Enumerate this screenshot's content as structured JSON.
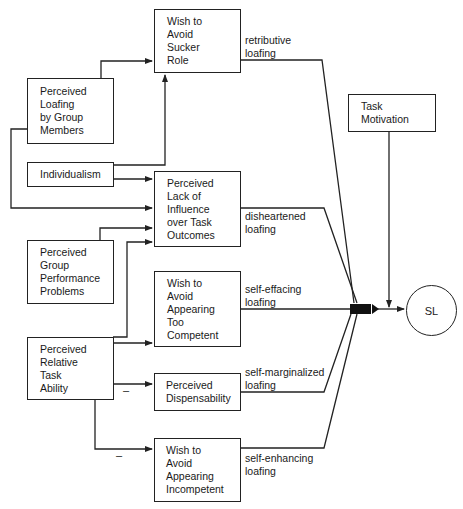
{
  "diagram": {
    "type": "path-model",
    "nodes": {
      "sucker": {
        "lines": [
          "Wish to",
          "Avoid",
          "Sucker",
          "Role"
        ]
      },
      "loafing_members": {
        "lines": [
          "Perceived",
          "Loafing",
          "by Group",
          "Members"
        ]
      },
      "individualism": {
        "lines": [
          "Individualism"
        ]
      },
      "lack_influence": {
        "lines": [
          "Perceived",
          "Lack of",
          "Influence",
          "over Task",
          "Outcomes"
        ]
      },
      "group_problems": {
        "lines": [
          "Perceived",
          "Group",
          "Performance",
          "Problems"
        ]
      },
      "too_competent": {
        "lines": [
          "Wish to",
          "Avoid",
          "Appearing",
          "Too",
          "Competent"
        ]
      },
      "task_ability": {
        "lines": [
          "Perceived",
          "Relative",
          "Task",
          "Ability"
        ]
      },
      "dispensability": {
        "lines": [
          "Perceived",
          "Dispensability"
        ]
      },
      "incompetent": {
        "lines": [
          "Wish to",
          "Avoid",
          "Appearing",
          "Incompetent"
        ]
      },
      "task_motivation": {
        "lines": [
          "Task",
          "Motivation"
        ]
      },
      "sl": {
        "label": "SL"
      }
    },
    "path_labels": {
      "retributive": [
        "retributive",
        "loafing"
      ],
      "disheartened": [
        "disheartened",
        "loafing"
      ],
      "self_effacing": [
        "self-effacing",
        "loafing"
      ],
      "self_marginalized": [
        "self-marginalized",
        "loafing"
      ],
      "self_enhancing": [
        "self-enhancing",
        "loafing"
      ]
    },
    "signs": {
      "dispensability_sign": "–",
      "incompetent_sign": "–"
    },
    "edges": [
      {
        "from": "Perceived Loafing by Group Members",
        "to": "Wish to Avoid Sucker Role"
      },
      {
        "from": "Individualism",
        "to": "Wish to Avoid Sucker Role"
      },
      {
        "from": "Individualism",
        "to": "Perceived Lack of Influence over Task Outcomes"
      },
      {
        "from": "Perceived Loafing by Group Members",
        "to": "Perceived Lack of Influence over Task Outcomes"
      },
      {
        "from": "Perceived Group Performance Problems",
        "to": "Perceived Lack of Influence over Task Outcomes"
      },
      {
        "from": "Perceived Relative Task Ability",
        "to": "Perceived Lack of Influence over Task Outcomes"
      },
      {
        "from": "Perceived Relative Task Ability",
        "to": "Wish to Avoid Appearing Too Competent"
      },
      {
        "from": "Perceived Relative Task Ability",
        "to": "Perceived Dispensability",
        "sign": "-"
      },
      {
        "from": "Perceived Relative Task Ability",
        "to": "Wish to Avoid Appearing Incompetent",
        "sign": "-"
      },
      {
        "from": "Wish to Avoid Sucker Role",
        "to": "SL",
        "label": "retributive loafing"
      },
      {
        "from": "Perceived Lack of Influence over Task Outcomes",
        "to": "SL",
        "label": "disheartened loafing"
      },
      {
        "from": "Wish to Avoid Appearing Too Competent",
        "to": "SL",
        "label": "self-effacing loafing"
      },
      {
        "from": "Perceived Dispensability",
        "to": "SL",
        "label": "self-marginalized loafing"
      },
      {
        "from": "Wish to Avoid Appearing Incompetent",
        "to": "SL",
        "label": "self-enhancing loafing"
      },
      {
        "from": "Task Motivation",
        "to": "SL"
      }
    ],
    "colors": {
      "line": "#222222",
      "background": "#ffffff",
      "node_fill": "#111111"
    }
  }
}
